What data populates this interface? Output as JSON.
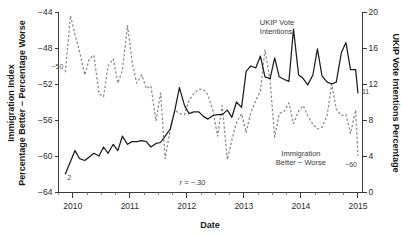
{
  "chart_data": {
    "type": "line",
    "title": "",
    "xlabel": "Date",
    "ylabel": "Immigration Index Percentage Better − Percentage Worse",
    "ylabel_right": "UKIP Vote Intentions Percentage",
    "grid": false,
    "legend_position": "inline-annotations",
    "xlim": [
      2009.75,
      2015.08
    ],
    "x_major_ticks": [
      2010,
      2011,
      2012,
      2013,
      2014,
      2015
    ],
    "x_major_tick_labels": [
      "2010",
      "2011",
      "2012",
      "2013",
      "2014",
      "2015"
    ],
    "x_minor_tick_interval_months": 3,
    "ylim_left": [
      -64,
      -44
    ],
    "y_left_ticks": [
      -44,
      -48,
      -52,
      -56,
      -60,
      -64
    ],
    "y_left_tick_labels": [
      "−44",
      "−48",
      "−52",
      "−56",
      "−60",
      "−64"
    ],
    "ylim_right": [
      0,
      20
    ],
    "y_right_ticks": [
      0,
      4,
      8,
      12,
      16,
      20
    ],
    "y_right_tick_labels": [
      "0",
      "4",
      "8",
      "12",
      "16",
      "20"
    ],
    "annotations": [
      {
        "name": "ukip-series-label",
        "text": "UKIP Vote\nIntentions",
        "line1": "UKIP Vote",
        "line2": "Intentions",
        "x": 2013.28,
        "y_right": 18.6
      },
      {
        "name": "immigration-series-label",
        "text": "Immigration\nBetter − Worse",
        "line1": "Immigration",
        "line2": "Better − Worse",
        "x": 2014.0,
        "y_left": -60.0
      },
      {
        "name": "correlation-label",
        "text": "r = −.30",
        "symbol": "r",
        "value": "= −.30",
        "x": 2012.1,
        "y_left": -63.2
      }
    ],
    "endpoint_labels": [
      {
        "name": "ukip-start-value",
        "text": "2",
        "series": "UKIP Vote Intentions",
        "x": 2009.87,
        "value": 2
      },
      {
        "name": "ukip-end-value",
        "text": "11",
        "series": "UKIP Vote Intentions",
        "x": 2015.0,
        "value": 11
      },
      {
        "name": "immigration-start-value",
        "text": "−50",
        "series": "Immigration Better − Worse",
        "x": 2009.87,
        "value": -50
      },
      {
        "name": "immigration-end-value",
        "text": "−60",
        "series": "Immigration Better − Worse",
        "x": 2015.0,
        "value": -60
      }
    ],
    "series": [
      {
        "name": "UKIP Vote Intentions",
        "axis": "right",
        "style": "solid",
        "color": "#1c1c1c",
        "unit": "percentage",
        "x": [
          2009.87,
          2009.96,
          2010.04,
          2010.12,
          2010.21,
          2010.29,
          2010.37,
          2010.46,
          2010.54,
          2010.62,
          2010.71,
          2010.79,
          2010.87,
          2010.96,
          2011.04,
          2011.12,
          2011.21,
          2011.29,
          2011.37,
          2011.46,
          2011.54,
          2011.62,
          2011.71,
          2011.79,
          2011.87,
          2011.96,
          2012.04,
          2012.12,
          2012.21,
          2012.29,
          2012.37,
          2012.46,
          2012.54,
          2012.62,
          2012.71,
          2012.79,
          2012.87,
          2012.96,
          2013.04,
          2013.12,
          2013.21,
          2013.29,
          2013.37,
          2013.46,
          2013.54,
          2013.62,
          2013.71,
          2013.79,
          2013.87,
          2013.96,
          2014.04,
          2014.12,
          2014.21,
          2014.29,
          2014.37,
          2014.46,
          2014.54,
          2014.62,
          2014.71,
          2014.79,
          2014.87,
          2014.96,
          2015.0
        ],
        "values": [
          2.0,
          3.4,
          4.6,
          3.7,
          3.5,
          3.9,
          4.3,
          4.0,
          5.0,
          4.3,
          5.3,
          4.6,
          6.2,
          5.3,
          5.6,
          5.6,
          5.7,
          5.6,
          5.0,
          5.4,
          5.5,
          6.2,
          7.0,
          9.1,
          11.6,
          9.6,
          8.7,
          8.9,
          8.9,
          8.4,
          8.1,
          8.5,
          8.6,
          8.6,
          9.1,
          8.3,
          10.0,
          9.4,
          13.4,
          14.0,
          13.8,
          15.1,
          12.8,
          12.6,
          14.9,
          12.8,
          12.5,
          12.3,
          18.1,
          13.0,
          12.6,
          11.9,
          13.0,
          15.9,
          12.9,
          12.2,
          12.0,
          12.2,
          15.5,
          16.6,
          13.6,
          13.6,
          11.0
        ]
      },
      {
        "name": "Immigration Better − Worse",
        "axis": "left",
        "style": "dashed",
        "color": "#8a8a8a",
        "unit": "index",
        "x": [
          2009.87,
          2009.96,
          2010.04,
          2010.12,
          2010.21,
          2010.29,
          2010.37,
          2010.46,
          2010.54,
          2010.62,
          2010.71,
          2010.79,
          2010.87,
          2010.96,
          2011.04,
          2011.12,
          2011.21,
          2011.29,
          2011.37,
          2011.46,
          2011.54,
          2011.62,
          2011.71,
          2011.79,
          2011.87,
          2011.96,
          2012.04,
          2012.12,
          2012.21,
          2012.29,
          2012.37,
          2012.46,
          2012.54,
          2012.62,
          2012.71,
          2012.79,
          2012.87,
          2012.96,
          2013.04,
          2013.12,
          2013.21,
          2013.29,
          2013.37,
          2013.46,
          2013.54,
          2013.62,
          2013.71,
          2013.79,
          2013.87,
          2013.96,
          2014.04,
          2014.12,
          2014.21,
          2014.29,
          2014.37,
          2014.46,
          2014.54,
          2014.62,
          2014.71,
          2014.79,
          2014.87,
          2014.96,
          2015.0
        ],
        "values": [
          -50.7,
          -44.4,
          -46.5,
          -48.4,
          -51.0,
          -49.2,
          -48.8,
          -53.1,
          -53.4,
          -50.0,
          -49.2,
          -51.9,
          -50.5,
          -45.5,
          -49.5,
          -51.9,
          -51.0,
          -52.5,
          -52.2,
          -56.1,
          -53.0,
          -60.3,
          -57.0,
          -54.9,
          -55.3,
          -55.4,
          -53.8,
          -53.1,
          -52.6,
          -52.6,
          -53.2,
          -55.0,
          -57.8,
          -54.4,
          -60.4,
          -58.2,
          -56.3,
          -55.3,
          -57.4,
          -55.2,
          -53.8,
          -52.8,
          -48.2,
          -51.6,
          -57.9,
          -55.3,
          -55.0,
          -54.1,
          -56.4,
          -55.0,
          -54.4,
          -55.5,
          -56.5,
          -57.0,
          -56.8,
          -55.5,
          -52.0,
          -54.8,
          -55.5,
          -55.4,
          -57.5,
          -54.9,
          -60.0
        ]
      }
    ]
  }
}
